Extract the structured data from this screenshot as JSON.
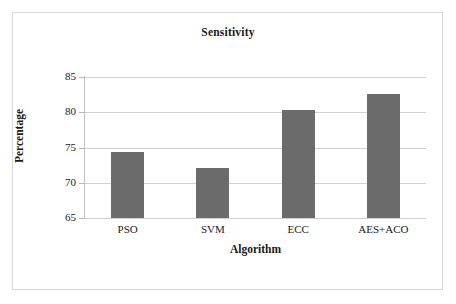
{
  "chart_data": {
    "type": "bar",
    "title": "Sensitivity",
    "xlabel": "Algorithm",
    "ylabel": "Percentage",
    "categories": [
      "PSO",
      "SVM",
      "ECC",
      "AES+ACO"
    ],
    "values": [
      74.3,
      72.1,
      80.3,
      82.6
    ],
    "ylim": [
      65,
      85
    ],
    "yticks": [
      65,
      70,
      75,
      80,
      85
    ],
    "ytick_labels": [
      "65",
      "70",
      "75",
      "80",
      "85"
    ],
    "grid": true,
    "legend": "none",
    "series_color": "#6b6b6b",
    "gridline_color": "#d0d0d0",
    "axis_color": "#c2c2c2",
    "frame_color": "#d8d8d8",
    "background": "#ffffff"
  }
}
